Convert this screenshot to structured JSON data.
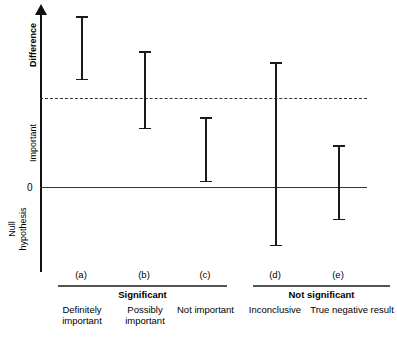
{
  "chart_data": {
    "type": "error-bar",
    "title": "",
    "xlabel": "",
    "ylabel": "Difference",
    "grid": false,
    "legend": "none",
    "y_axis": {
      "label_top": "Difference",
      "label_mid": "Important",
      "label_zero": "0",
      "label_bottom": "Null hypothesis",
      "reference_lines": [
        {
          "name": "important-difference-threshold",
          "style": "dashed",
          "value": "important"
        },
        {
          "name": "null-hypothesis-zero",
          "style": "solid",
          "value": "0"
        }
      ]
    },
    "categories": [
      "(a)",
      "(b)",
      "(c)",
      "(d)",
      "(e)"
    ],
    "series": [
      {
        "name": "confidence-interval",
        "points": [
          {
            "marker": "(a)",
            "label": "Definitely important",
            "group": "Significant",
            "upper_px": 16,
            "lower_px": 80,
            "center_px": 81,
            "crosses_zero": false,
            "crosses_threshold": false
          },
          {
            "marker": "(b)",
            "label": "Possibly important",
            "group": "Significant",
            "upper_px": 51,
            "lower_px": 129,
            "center_px": 144,
            "crosses_zero": false,
            "crosses_threshold": true
          },
          {
            "marker": "(c)",
            "label": "Not important",
            "group": "Significant",
            "upper_px": 117,
            "lower_px": 182,
            "center_px": 205,
            "crosses_zero": false,
            "crosses_threshold": false
          },
          {
            "marker": "(d)",
            "label": "Inconclusive",
            "group": "Not significant",
            "upper_px": 62,
            "lower_px": 246,
            "center_px": 275,
            "crosses_zero": true,
            "crosses_threshold": true
          },
          {
            "marker": "(e)",
            "label": "True negative result",
            "group": "Not significant",
            "upper_px": 145,
            "lower_px": 220,
            "center_px": 338,
            "crosses_zero": true,
            "crosses_threshold": false
          }
        ]
      }
    ],
    "groups": [
      {
        "label": "Significant",
        "members": [
          "(a)",
          "(b)",
          "(c)"
        ]
      },
      {
        "label": "Not significant",
        "members": [
          "(d)",
          "(e)"
        ]
      }
    ]
  },
  "axis": {
    "difference": "Difference",
    "important": "Important",
    "zero": "0",
    "null_hypothesis": "Null\nhypothesis"
  },
  "markers": {
    "a": "(a)",
    "b": "(b)",
    "c": "(c)",
    "d": "(d)",
    "e": "(e)"
  },
  "groups": {
    "significant": "Significant",
    "not_significant": "Not significant"
  },
  "categories": {
    "a": "Definitely important",
    "b": "Possibly important",
    "c": "Not important",
    "d": "Inconclusive",
    "e": "True negative result"
  },
  "colors": {
    "line": "#1a1a1a",
    "reference": "#333333",
    "background": "#ffffff"
  }
}
